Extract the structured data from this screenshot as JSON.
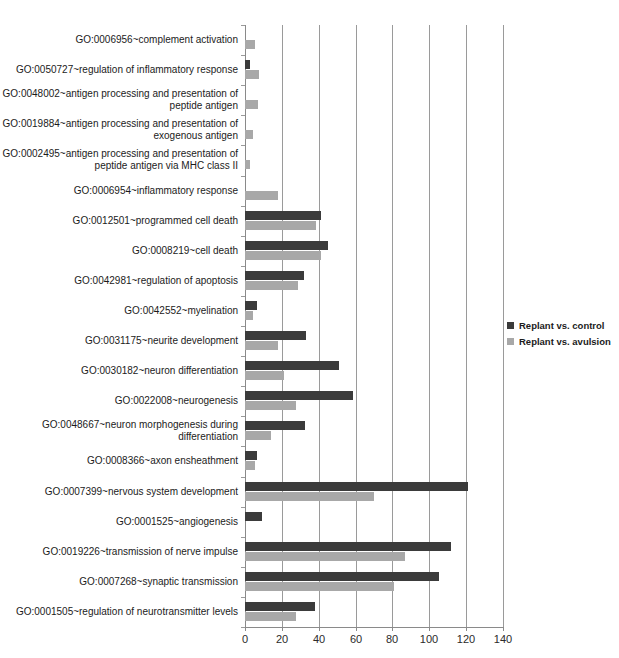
{
  "title_strip": "",
  "chart_data": {
    "type": "bar",
    "orientation": "horizontal",
    "title": "",
    "xlabel": "",
    "ylabel": "",
    "xlim": [
      0,
      140
    ],
    "xticks": [
      0,
      20,
      40,
      60,
      80,
      100,
      120,
      140
    ],
    "grid": true,
    "legend_position": "right",
    "colors": {
      "series0": "#3b3b3b",
      "series1": "#a8a8a8",
      "axis": "#8a8a8a",
      "gridline": "#9a9a9a",
      "text": "#1b1b1b",
      "background": "#ffffff"
    },
    "categories": [
      "GO:0006956~complement activation",
      "GO:0050727~regulation of inflammatory response",
      "GO:0048002~antigen processing and presentation of peptide antigen",
      "GO:0019884~antigen processing and presentation of exogenous antigen",
      "GO:0002495~antigen processing and presentation of peptide antigen via MHC class II",
      "GO:0006954~inflammatory response",
      "GO:0012501~programmed cell death",
      "GO:0008219~cell death",
      "GO:0042981~regulation of apoptosis",
      "GO:0042552~myelination",
      "GO:0031175~neurite development",
      "GO:0030182~neuron differentiation",
      "GO:0022008~neurogenesis",
      "GO:0048667~neuron morphogenesis during differentiation",
      "GO:0008366~axon ensheathment",
      "GO:0007399~nervous system development",
      "GO:0001525~angiogenesis",
      "GO:0019226~transmission of nerve impulse",
      "GO:0007268~synaptic transmission",
      "GO:0001505~regulation of neurotransmitter levels"
    ],
    "series": [
      {
        "name": "Replant vs. control",
        "color": "#3b3b3b",
        "values": [
          0,
          2.7,
          0,
          0,
          0,
          0,
          41,
          45,
          32,
          6.5,
          33,
          51,
          58.5,
          32.5,
          6.5,
          121,
          9,
          112,
          105,
          38
        ]
      },
      {
        "name": "Replant vs. avulsion",
        "color": "#a8a8a8",
        "values": [
          5.4,
          7.6,
          7.2,
          4.3,
          2.7,
          18,
          38.5,
          41,
          29,
          4.3,
          18,
          21,
          27.7,
          14,
          5.3,
          70,
          0,
          87,
          81,
          27.5
        ]
      }
    ]
  },
  "legend": {
    "items": [
      {
        "label": "Replant vs. control",
        "swatch": "series0"
      },
      {
        "label": "Replant vs. avulsion",
        "swatch": "series1"
      }
    ]
  },
  "axis": {
    "tick_labels": [
      "0",
      "20",
      "40",
      "60",
      "80",
      "100",
      "120",
      "140"
    ]
  }
}
